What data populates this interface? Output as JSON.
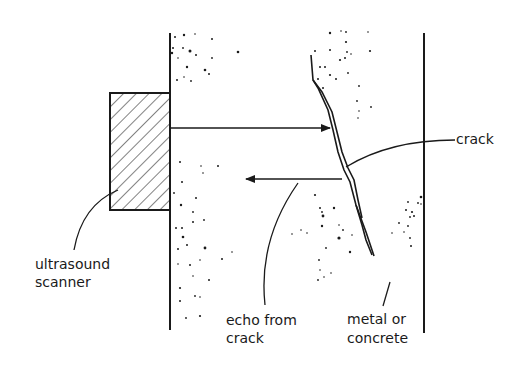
{
  "diagram": {
    "labels": {
      "crack": "crack",
      "scanner_line1": "ultrasound",
      "scanner_line2": "scanner",
      "echo_line1": "echo from",
      "echo_line2": "crack",
      "material_line1": "metal or",
      "material_line2": "concrete"
    },
    "colors": {
      "ink": "#1a1a1a",
      "background": "#ffffff"
    }
  }
}
